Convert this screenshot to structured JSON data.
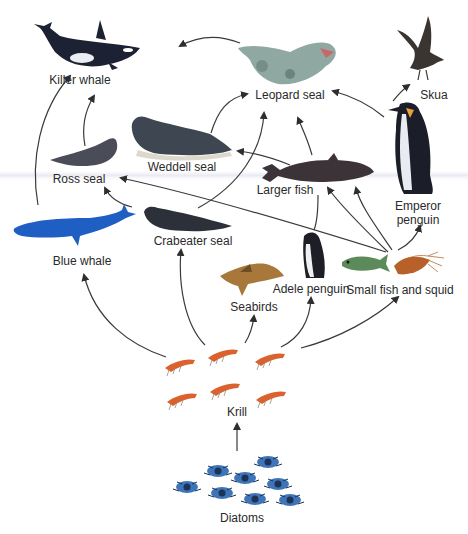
{
  "nodes": {
    "killer_whale": {
      "label": "Killer whale",
      "lx": 80,
      "ly": 73
    },
    "leopard_seal": {
      "label": "Leopard seal",
      "lx": 290,
      "ly": 88
    },
    "skua": {
      "label": "Skua",
      "lx": 434,
      "ly": 88
    },
    "weddell_seal": {
      "label": "Weddell seal",
      "lx": 182,
      "ly": 160
    },
    "ross_seal": {
      "label": "Ross seal",
      "lx": 79,
      "ly": 172
    },
    "larger_fish": {
      "label": "Larger fish",
      "lx": 285,
      "ly": 183
    },
    "emperor_penguin": {
      "label_line1": "Emperor",
      "label_line2": "penguin",
      "lx": 418,
      "ly": 199
    },
    "blue_whale": {
      "label": "Blue whale",
      "lx": 82,
      "ly": 254
    },
    "crabeater_seal": {
      "label": "Crabeater seal",
      "lx": 193,
      "ly": 234
    },
    "seabirds": {
      "label": "Seabirds",
      "lx": 254,
      "ly": 300
    },
    "adele_penguin": {
      "label": "Adele penguin",
      "lx": 311,
      "ly": 282
    },
    "small_fish_and_squid": {
      "label": "Small fish and squid",
      "lx": 396,
      "ly": 282
    },
    "krill": {
      "label": "Krill",
      "lx": 237,
      "ly": 405
    },
    "diatoms": {
      "label": "Diatoms",
      "lx": 242,
      "ly": 511
    }
  },
  "edges": [
    {
      "from": "Diatoms",
      "to": "Krill"
    },
    {
      "from": "Krill",
      "to": "Blue whale"
    },
    {
      "from": "Krill",
      "to": "Crabeater seal"
    },
    {
      "from": "Krill",
      "to": "Seabirds"
    },
    {
      "from": "Krill",
      "to": "Adele penguin"
    },
    {
      "from": "Krill",
      "to": "Small fish and squid"
    },
    {
      "from": "Small fish and squid",
      "to": "Emperor penguin"
    },
    {
      "from": "Small fish and squid",
      "to": "Larger fish"
    },
    {
      "from": "Small fish and squid",
      "to": "Ross seal"
    },
    {
      "from": "Larger fish",
      "to": "Weddell seal"
    },
    {
      "from": "Larger fish",
      "to": "Leopard seal"
    },
    {
      "from": "Crabeater seal",
      "to": "Leopard seal"
    },
    {
      "from": "Crabeater seal",
      "to": "Ross seal"
    },
    {
      "from": "Weddell seal",
      "to": "Leopard seal"
    },
    {
      "from": "Emperor penguin",
      "to": "Leopard seal"
    },
    {
      "from": "Emperor penguin",
      "to": "Skua"
    },
    {
      "from": "Ross seal",
      "to": "Killer whale"
    },
    {
      "from": "Blue whale",
      "to": "Killer whale"
    },
    {
      "from": "Leopard seal",
      "to": "Killer whale"
    }
  ],
  "colors": {
    "arrow": "#3a3a3a",
    "label": "#2a2a2a",
    "orca_dark": "#1c2233",
    "blue_whale": "#1f5fc4",
    "krill": "#d9622e",
    "diatom": "#3f74b8"
  }
}
